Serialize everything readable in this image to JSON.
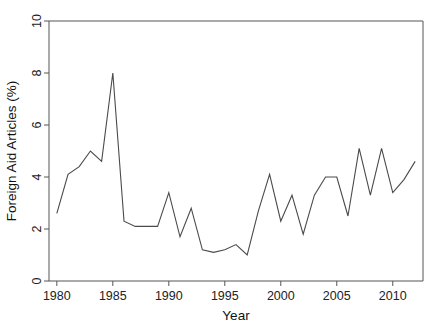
{
  "chart_data": {
    "type": "line",
    "title": "",
    "subtitle": "",
    "xlabel": "Year",
    "ylabel": "Foreign Aid Articles (%)",
    "xlim": [
      1979.3,
      1914.0
    ],
    "x_axis_range": [
      1979.3,
      2012.7
    ],
    "ylim": [
      0,
      10
    ],
    "yticks": [
      0,
      2,
      4,
      6,
      8,
      10
    ],
    "ytick_labels": [
      "0",
      "2",
      "4",
      "6",
      "8",
      "10"
    ],
    "xticks": [
      1980,
      1985,
      1990,
      1995,
      2000,
      2005,
      2010
    ],
    "xtick_labels": [
      "1980",
      "1985",
      "1990",
      "1995",
      "2000",
      "2005",
      "2010"
    ],
    "grid": false,
    "legend": false,
    "legend_position": "none",
    "line_color": "#4a4a4a",
    "series": [
      {
        "name": "Foreign Aid Articles (%)",
        "x": [
          1980,
          1981,
          1982,
          1983,
          1984,
          1985,
          1986,
          1987,
          1988,
          1989,
          1990,
          1991,
          1992,
          1993,
          1994,
          1995,
          1996,
          1997,
          1998,
          1999,
          2000,
          2001,
          2002,
          2003,
          2004,
          2005,
          2006,
          2007,
          2008,
          2009,
          2010,
          2011,
          2012
        ],
        "values": [
          2.6,
          4.1,
          4.4,
          5.0,
          4.6,
          8.0,
          2.3,
          2.1,
          2.1,
          2.1,
          3.4,
          1.7,
          2.8,
          1.2,
          1.1,
          1.2,
          1.4,
          1.0,
          2.7,
          4.1,
          2.3,
          3.3,
          1.8,
          3.3,
          4.0,
          4.0,
          2.5,
          5.1,
          3.3,
          5.1,
          3.4,
          3.9,
          4.6
        ]
      }
    ]
  }
}
